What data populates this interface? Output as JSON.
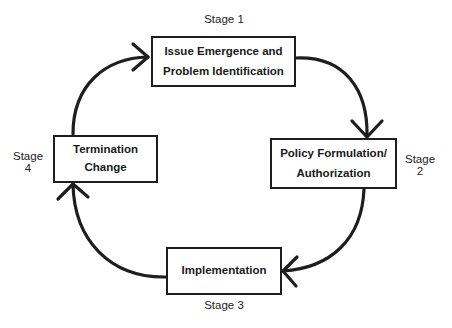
{
  "diagram": {
    "type": "cycle",
    "stages": [
      {
        "id": 1,
        "label": "Stage 1",
        "lines": [
          "Issue Emergence and",
          "Problem Identification"
        ]
      },
      {
        "id": 2,
        "label_line1": "Stage",
        "label_line2": "2",
        "lines": [
          "Policy Formulation/",
          "Authorization"
        ]
      },
      {
        "id": 3,
        "label": "Stage 3",
        "lines": [
          "Implementation"
        ]
      },
      {
        "id": 4,
        "label_line1": "Stage",
        "label_line2": "4",
        "lines": [
          "Termination",
          "Change"
        ]
      }
    ],
    "connections": [
      {
        "from": 1,
        "to": 2,
        "direction": "clockwise"
      },
      {
        "from": 2,
        "to": 3,
        "direction": "clockwise"
      },
      {
        "from": 3,
        "to": 4,
        "direction": "clockwise"
      },
      {
        "from": 4,
        "to": 1,
        "direction": "clockwise"
      }
    ],
    "colors": {
      "stroke": "#1e1e1e",
      "background": "#ffffff",
      "text": "#1a1a1a"
    }
  }
}
